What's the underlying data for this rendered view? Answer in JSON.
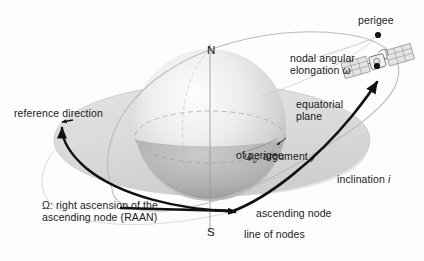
{
  "diagram": {
    "background_color": "#fdfdfd",
    "ink_color": "#1a1a1a"
  },
  "labels": {
    "reference_direction": "reference direction",
    "perigee": "perigee",
    "nodal_angular_line1": "nodal angular",
    "nodal_angular_line2": "elongation ω",
    "equatorial_line1": "equatorial",
    "equatorial_line2": "plane",
    "inclination": "inclination ",
    "inclination_symbol": "i",
    "argument_symbol": "ω",
    "argument_subscript": "0",
    "argument_line1": ": argument",
    "argument_line2": "of perigee",
    "raan_line1": "Ω: right ascension of the",
    "raan_line2": "ascending node (RAAN)",
    "ascending_node": "ascending node",
    "line_of_nodes": "line of nodes",
    "north_pole": "N",
    "south_pole": "S"
  },
  "elements": {
    "earth_sphere": "earth-sphere",
    "equatorial_plane": "equatorial-plane-disk",
    "orbital_ellipse": "orbit-path",
    "satellite": "satellite-icon",
    "perigee_marker": "perigee-dot",
    "polar_axis": "polar-axis",
    "node_line": "line-of-nodes",
    "raan_wedge": "raan-wedge"
  },
  "colors": {
    "plane_fill": "#d9d9d9",
    "sphere_light": "#fbfbfb",
    "sphere_mid": "#d2d2d2",
    "sphere_dark": "#9a9a9a",
    "orbit_stroke": "#b4b4b4",
    "bold_stroke": "#111111",
    "wedge_stroke": "#d0d0d0"
  }
}
